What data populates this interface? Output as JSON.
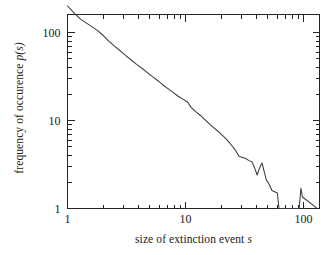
{
  "figure": {
    "background_color": "#ffffff",
    "line_color": "#3a3a3a",
    "axis_color": "#242424"
  },
  "axis_labels": {
    "x_title_plain": "size of extinction event ",
    "x_title_italic": "s",
    "y_title_plain": "frequency of occurence ",
    "y_title_italic": "p(s)"
  },
  "ticks": {
    "x_labels": [
      "1",
      "10",
      "100"
    ],
    "y_labels": [
      "1",
      "10",
      "100"
    ]
  },
  "chart_data": {
    "type": "line",
    "title": "",
    "subtitle": "",
    "xlabel": "size of extinction event s",
    "ylabel": "frequency of occurence p(s)",
    "xscale": "log",
    "yscale": "log",
    "xlim": [
      1,
      145
    ],
    "ylim": [
      1,
      200
    ],
    "xticks": [
      1,
      10,
      100
    ],
    "xticklabels": [
      "1",
      "10",
      "100"
    ],
    "yticks": [
      1,
      10,
      100
    ],
    "yticklabels": [
      "1",
      "10",
      "100"
    ],
    "x_minor_ticks": [
      2,
      3,
      4,
      5,
      6,
      7,
      8,
      9,
      20,
      30,
      40,
      50,
      60,
      70,
      80,
      90,
      200
    ],
    "y_minor_ticks": [
      2,
      3,
      4,
      5,
      6,
      7,
      8,
      9,
      20,
      30,
      40,
      50,
      60,
      70,
      80,
      90,
      200
    ],
    "grid": false,
    "legend": null,
    "annotations": [],
    "series": [
      {
        "name": "extinction event size distribution",
        "x": [
          1.0,
          1.13,
          1.28,
          1.45,
          1.62,
          1.8,
          2.0,
          2.24,
          2.5,
          2.8,
          3.1,
          3.45,
          3.85,
          4.3,
          4.75,
          5.25,
          5.8,
          6.4,
          7.1,
          7.8,
          8.6,
          9.5,
          10.4,
          11.2,
          12.2,
          13.4,
          14.6,
          16.0,
          17.5,
          19.2,
          21.0,
          22.8,
          24.6,
          26.5,
          28.5,
          30.5,
          32.5,
          34.5,
          36.5,
          38.5,
          40.5,
          42.5,
          44.5,
          46.5,
          48.5,
          51.0,
          54.0,
          57.0,
          60.0,
          62.0,
          92.0,
          95.0,
          98.0,
          125.0,
          130.0
        ],
        "y": [
          200.0,
          168.0,
          143.0,
          128.0,
          116.0,
          105.0,
          93.0,
          80.0,
          70.0,
          62.0,
          55.0,
          49.0,
          43.5,
          39.0,
          35.0,
          31.5,
          28.5,
          25.5,
          23.0,
          21.0,
          19.0,
          17.5,
          16.2,
          14.0,
          12.6,
          11.4,
          10.2,
          9.1,
          8.2,
          7.4,
          6.6,
          5.9,
          5.2,
          4.6,
          3.9,
          3.8,
          3.7,
          3.5,
          3.4,
          2.9,
          2.4,
          2.9,
          3.3,
          2.6,
          2.1,
          1.9,
          1.6,
          1.55,
          1.5,
          1.0,
          1.0,
          1.7,
          1.35,
          1.05,
          1.0
        ]
      }
    ]
  }
}
